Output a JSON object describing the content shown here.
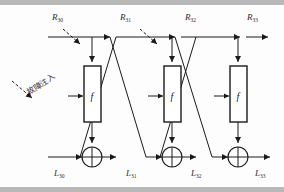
{
  "figure": {
    "type": "feistel-network-fault-injection-diagram",
    "annotation_cjk": "故障注入",
    "round_function_label": "f"
  },
  "top_labels": [
    {
      "name": "R30",
      "base": "R",
      "sub": "30",
      "x": 52,
      "y": 12
    },
    {
      "name": "R31",
      "base": "R",
      "sub": "31",
      "x": 120,
      "y": 12
    },
    {
      "name": "R32",
      "base": "R",
      "sub": "32",
      "x": 185,
      "y": 12
    },
    {
      "name": "R33",
      "base": "R",
      "sub": "33",
      "x": 247,
      "y": 12
    }
  ],
  "bottom_labels": [
    {
      "name": "L30",
      "base": "L",
      "sub": "30",
      "x": 54,
      "y": 170
    },
    {
      "name": "L31",
      "base": "L",
      "sub": "31",
      "x": 126,
      "y": 170
    },
    {
      "name": "L32",
      "base": "L",
      "sub": "32",
      "x": 191,
      "y": 170
    },
    {
      "name": "L33",
      "base": "L",
      "sub": "33",
      "x": 255,
      "y": 170
    }
  ],
  "stages": [
    {
      "index": 1,
      "f_label": "f",
      "has_fault_arrow": true
    },
    {
      "index": 2,
      "f_label": "f",
      "has_fault_arrow": true
    },
    {
      "index": 3,
      "f_label": "f",
      "has_fault_arrow": false
    }
  ],
  "colors": {
    "line": "#1a1a1a",
    "band": "#b9b9b9",
    "background": "#fdfdfd",
    "text": "#2b2b2b"
  }
}
